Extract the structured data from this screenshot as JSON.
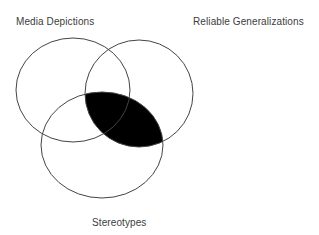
{
  "diagram": {
    "type": "venn",
    "sets": [
      {
        "id": "media",
        "label": "Media Depictions",
        "cx": 73,
        "cy": 90,
        "rx": 57,
        "ry": 52
      },
      {
        "id": "reliable",
        "label": "Reliable Generalizations",
        "cx": 139,
        "cy": 93.5,
        "rx": 54,
        "ry": 53.5
      },
      {
        "id": "stereotypes",
        "label": "Stereotypes",
        "cx": 102,
        "cy": 145,
        "rx": 61,
        "ry": 53
      }
    ],
    "highlighted_region": {
      "description": "Intersection of Reliable Generalizations and Stereotypes",
      "sets": [
        "reliable",
        "stereotypes"
      ],
      "fill": "#000000"
    },
    "stroke_color": "#444444",
    "background": "#ffffff"
  }
}
